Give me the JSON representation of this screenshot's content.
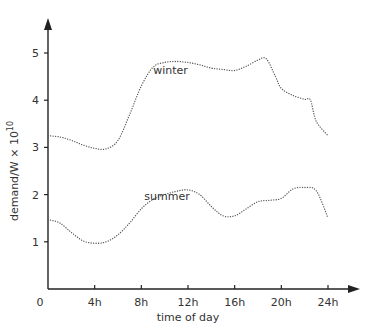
{
  "chart_data": {
    "type": "line",
    "title": "",
    "xlabel": "time of day",
    "ylabel": "demand/W × 10",
    "ylabel_superscript": "10",
    "x_ticks": [
      "0",
      "4h",
      "8h",
      "12h",
      "16h",
      "20h",
      "24h"
    ],
    "y_ticks": [
      "1",
      "2",
      "3",
      "4",
      "5"
    ],
    "xlim": [
      0,
      24
    ],
    "ylim": [
      0,
      5.6
    ],
    "grid": false,
    "legend": "inline labels",
    "series": [
      {
        "name": "winter",
        "label_position": {
          "x": 10.5,
          "y": 4.55
        },
        "x": [
          0,
          1,
          2,
          3,
          4,
          5,
          6,
          7,
          8,
          9,
          10,
          11,
          12,
          13,
          14,
          15,
          16,
          17,
          18,
          18.7,
          19.5,
          20,
          21,
          22,
          22.5,
          23,
          24
        ],
        "values": [
          3.25,
          3.22,
          3.15,
          3.05,
          2.98,
          2.97,
          3.15,
          3.7,
          4.3,
          4.7,
          4.8,
          4.82,
          4.8,
          4.75,
          4.68,
          4.65,
          4.63,
          4.72,
          4.85,
          4.88,
          4.5,
          4.25,
          4.1,
          4.02,
          4.0,
          3.55,
          3.25
        ]
      },
      {
        "name": "summer",
        "label_position": {
          "x": 10.2,
          "y": 1.88
        },
        "x": [
          0,
          1,
          2,
          3,
          4,
          5,
          6,
          7,
          8,
          9,
          10,
          11,
          12,
          13,
          14,
          15,
          16,
          17,
          18,
          19,
          20,
          21,
          22,
          23,
          24
        ],
        "values": [
          1.47,
          1.4,
          1.2,
          1.02,
          0.97,
          1.0,
          1.15,
          1.4,
          1.7,
          1.9,
          2.0,
          2.07,
          2.1,
          2.0,
          1.75,
          1.55,
          1.55,
          1.7,
          1.85,
          1.88,
          1.92,
          2.12,
          2.15,
          2.08,
          1.5
        ]
      }
    ]
  },
  "colors": {
    "axis": "#222222",
    "series_line": "#555555",
    "text": "#333333",
    "background": "#ffffff"
  }
}
